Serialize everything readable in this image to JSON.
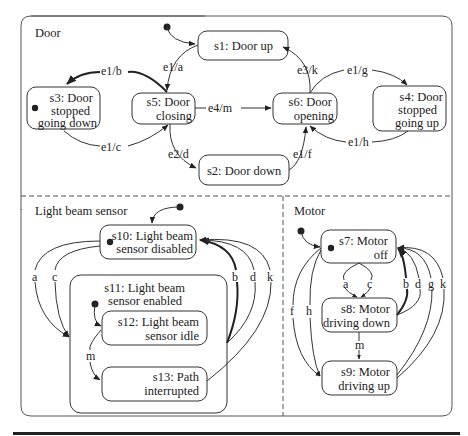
{
  "regions": {
    "door": "Door",
    "light_beam_sensor": "Light beam sensor",
    "motor": "Motor"
  },
  "states": {
    "s1": {
      "line1": "s1: Door up"
    },
    "s2": {
      "line1": "s2: Door down"
    },
    "s3": {
      "line1": "s3: Door",
      "line2": "stopped",
      "line3": "going down"
    },
    "s4": {
      "line1": "s4: Door",
      "line2": "stopped",
      "line3": "going up"
    },
    "s5": {
      "line1": "s5: Door",
      "line2": "closing"
    },
    "s6": {
      "line1": "s6: Door",
      "line2": "opening"
    },
    "s7": {
      "line1": "s7: Motor",
      "line2": "off"
    },
    "s8": {
      "line1": "s8: Motor",
      "line2": "driving down"
    },
    "s9": {
      "line1": "s9: Motor",
      "line2": "driving up"
    },
    "s10": {
      "line1": "s10: Light beam",
      "line2": "sensor disabled"
    },
    "s11": {
      "line1": "s11: Light beam",
      "line2": "sensor enabled"
    },
    "s12": {
      "line1": "s12: Light beam",
      "line2": "sensor idle"
    },
    "s13": {
      "line1": "s13: Path",
      "line2": "interrupted"
    }
  },
  "transitions": {
    "door": [
      {
        "from": "s1",
        "to": "s5",
        "label": "e1/a"
      },
      {
        "from": "s5",
        "to": "s3",
        "label": "e1/b"
      },
      {
        "from": "s3",
        "to": "s5",
        "label": "e1/c"
      },
      {
        "from": "s5",
        "to": "s2",
        "label": "e2/d"
      },
      {
        "from": "s5",
        "to": "s6",
        "label": "e4/m"
      },
      {
        "from": "s2",
        "to": "s6",
        "label": "e1/f"
      },
      {
        "from": "s6",
        "to": "s1",
        "label": "e3/k"
      },
      {
        "from": "s6",
        "to": "s4",
        "label": "e1/g"
      },
      {
        "from": "s4",
        "to": "s6",
        "label": "e1/h"
      }
    ],
    "light_beam_sensor": [
      {
        "from": "s10",
        "to": "s11",
        "label": "a"
      },
      {
        "from": "s10",
        "to": "s11",
        "label": "c"
      },
      {
        "from": "s11",
        "to": "s10",
        "label": "b"
      },
      {
        "from": "s11",
        "to": "s10",
        "label": "d"
      },
      {
        "from": "s13",
        "to": "s10",
        "label": "k"
      },
      {
        "from": "s12",
        "to": "s13",
        "label": "m"
      }
    ],
    "motor": [
      {
        "from": "s7",
        "to": "s8",
        "label": "a"
      },
      {
        "from": "s7",
        "to": "s8",
        "label": "c"
      },
      {
        "from": "s8",
        "to": "s7",
        "label": "b"
      },
      {
        "from": "s8",
        "to": "s7",
        "label": "d"
      },
      {
        "from": "s9",
        "to": "s7",
        "label": "g"
      },
      {
        "from": "s9",
        "to": "s7",
        "label": "k"
      },
      {
        "from": "s7",
        "to": "s9",
        "label": "f"
      },
      {
        "from": "s7",
        "to": "s9",
        "label": "h"
      },
      {
        "from": "s8",
        "to": "s9",
        "label": "m"
      }
    ]
  },
  "colors": {
    "stroke": "#333333",
    "text": "#222222",
    "background": "#ffffff"
  }
}
